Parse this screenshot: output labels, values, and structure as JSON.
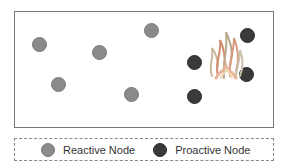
{
  "diagram": {
    "colors": {
      "reactive": "#8a8a8a",
      "proactive": "#3a3a3a",
      "border": "#777777"
    },
    "reactive_nodes": [
      {
        "x": 39,
        "y": 44
      },
      {
        "x": 99,
        "y": 52
      },
      {
        "x": 151,
        "y": 30
      },
      {
        "x": 58,
        "y": 84
      },
      {
        "x": 131,
        "y": 94
      }
    ],
    "proactive_nodes": [
      {
        "x": 194,
        "y": 62
      },
      {
        "x": 194,
        "y": 96
      },
      {
        "x": 247,
        "y": 35
      },
      {
        "x": 246,
        "y": 74
      }
    ],
    "fire": {
      "x": 226,
      "y": 55,
      "icon": "fire-icon"
    }
  },
  "legend": {
    "reactive_label": "Reactive Node",
    "proactive_label": "Proactive Node"
  }
}
